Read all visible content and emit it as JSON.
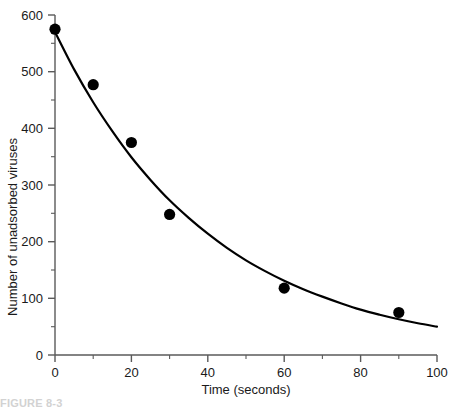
{
  "figure": {
    "caption_fragment": "FIGURE 8-3"
  },
  "chart_data": {
    "type": "scatter",
    "title": "",
    "xlabel": "Time (seconds)",
    "ylabel": "Number of unadsorbed viruses",
    "xlim": [
      0,
      100
    ],
    "ylim": [
      0,
      600
    ],
    "grid": false,
    "legend": "none",
    "x_major_ticks": [
      0,
      20,
      40,
      60,
      80,
      100
    ],
    "x_major_tick_labels": [
      "0",
      "20",
      "40",
      "60",
      "80",
      "100"
    ],
    "x_minor_tick_interval": 10,
    "y_major_ticks": [
      0,
      100,
      200,
      300,
      400,
      500,
      600
    ],
    "y_major_tick_labels": [
      "0",
      "100",
      "200",
      "300",
      "400",
      "500",
      "600"
    ],
    "y_minor_tick_interval": 50,
    "marker_color": "#000000",
    "curve_color": "#000000",
    "axis_color": "#5a5a5a",
    "series": [
      {
        "name": "Unadsorbed viruses",
        "kind": "scatter",
        "x": [
          0,
          10,
          20,
          30,
          60,
          90
        ],
        "values": [
          575,
          477,
          375,
          248,
          118,
          75
        ]
      },
      {
        "name": "Fitted exponential decay",
        "kind": "line",
        "x": [
          0,
          5,
          10,
          15,
          20,
          25,
          30,
          35,
          40,
          45,
          50,
          55,
          60,
          65,
          70,
          75,
          80,
          85,
          90,
          95,
          100
        ],
        "values": [
          570,
          504,
          446,
          395,
          349,
          309,
          273,
          242,
          214,
          189,
          167,
          148,
          131,
          116,
          103,
          91,
          80,
          71,
          63,
          56,
          50
        ]
      }
    ]
  }
}
